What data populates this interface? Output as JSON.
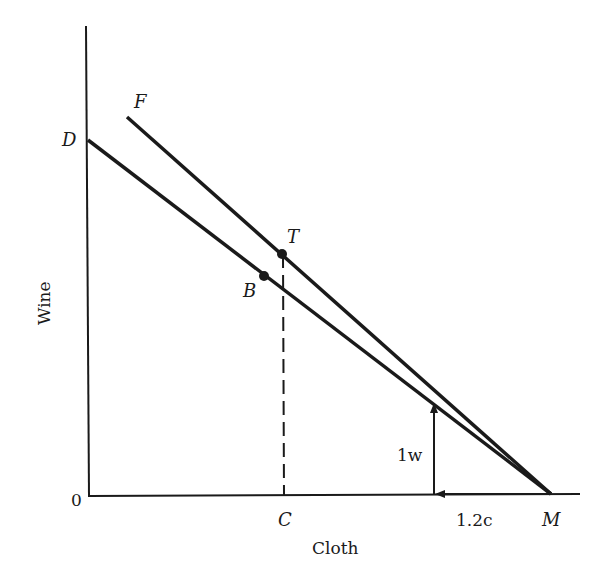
{
  "diagram": {
    "axes": {
      "x_label": "Cloth",
      "y_label": "Wine",
      "origin_label": "0"
    },
    "lines": [
      {
        "name": "DM",
        "start_label": "D",
        "end_label": "M"
      },
      {
        "name": "FM",
        "start_label": "F",
        "end_label": "M"
      }
    ],
    "points": [
      {
        "label": "T",
        "on_line": "FM"
      },
      {
        "label": "B",
        "on_line": "DM"
      }
    ],
    "x_markers": [
      {
        "label": "C"
      },
      {
        "label": "M"
      }
    ],
    "arrows": {
      "vertical_label": "1w",
      "horizontal_label": "1.2c"
    },
    "colors": {
      "ink": "#1a1a1a",
      "background": "#ffffff"
    }
  }
}
